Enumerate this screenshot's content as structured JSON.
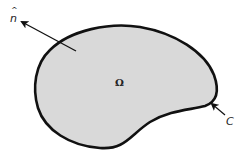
{
  "diagram": {
    "region_label": "Ω",
    "normal_label": "n",
    "normal_hat": "^",
    "boundary_label": "C",
    "colors": {
      "fill": "#d9d9d9",
      "stroke": "#111111",
      "background": "#ffffff"
    }
  }
}
